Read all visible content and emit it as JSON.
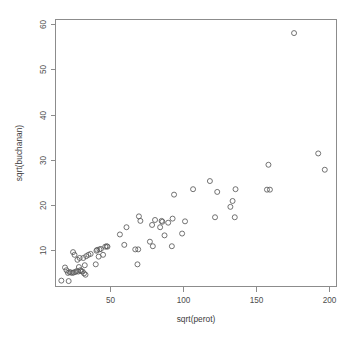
{
  "chart_data": {
    "type": "scatter",
    "title": "",
    "xlabel": "sqrt(perot)",
    "ylabel": "sqrt(buchanan)",
    "xlim": [
      13,
      205
    ],
    "ylim": [
      2,
      61
    ],
    "xticks": [
      50,
      100,
      150,
      200
    ],
    "yticks": [
      10,
      20,
      30,
      40,
      50,
      60
    ],
    "grid": false,
    "legend": null,
    "point_symbol": "open-circle",
    "point_color": "#5a5a5a",
    "axis_color": "#8c8c8c",
    "background_color": "#ffffff",
    "n_points": 67,
    "points": [
      {
        "x": 17.0,
        "y": 3.3
      },
      {
        "x": 22.0,
        "y": 3.2
      },
      {
        "x": 19.5,
        "y": 6.2
      },
      {
        "x": 20.5,
        "y": 5.6
      },
      {
        "x": 21.5,
        "y": 5.0
      },
      {
        "x": 22.5,
        "y": 5.2
      },
      {
        "x": 23.5,
        "y": 5.1
      },
      {
        "x": 24.5,
        "y": 5.0
      },
      {
        "x": 25.5,
        "y": 5.1
      },
      {
        "x": 26.5,
        "y": 5.2
      },
      {
        "x": 27.5,
        "y": 5.4
      },
      {
        "x": 28.5,
        "y": 5.3
      },
      {
        "x": 29.0,
        "y": 6.3
      },
      {
        "x": 30.0,
        "y": 5.6
      },
      {
        "x": 30.5,
        "y": 5.4
      },
      {
        "x": 31.5,
        "y": 5.3
      },
      {
        "x": 32.5,
        "y": 4.9
      },
      {
        "x": 33.0,
        "y": 6.7
      },
      {
        "x": 33.5,
        "y": 4.6
      },
      {
        "x": 25.0,
        "y": 9.6
      },
      {
        "x": 26.0,
        "y": 9.0
      },
      {
        "x": 28.0,
        "y": 7.9
      },
      {
        "x": 29.5,
        "y": 8.3
      },
      {
        "x": 32.0,
        "y": 8.3
      },
      {
        "x": 34.0,
        "y": 8.7
      },
      {
        "x": 35.5,
        "y": 9.0
      },
      {
        "x": 37.0,
        "y": 9.2
      },
      {
        "x": 40.5,
        "y": 6.9
      },
      {
        "x": 41.0,
        "y": 9.9
      },
      {
        "x": 41.5,
        "y": 10.1
      },
      {
        "x": 42.5,
        "y": 8.6
      },
      {
        "x": 43.0,
        "y": 10.2
      },
      {
        "x": 44.0,
        "y": 10.3
      },
      {
        "x": 45.5,
        "y": 9.0
      },
      {
        "x": 47.0,
        "y": 10.8
      },
      {
        "x": 48.0,
        "y": 10.9
      },
      {
        "x": 48.5,
        "y": 10.8
      },
      {
        "x": 57.0,
        "y": 13.5
      },
      {
        "x": 60.0,
        "y": 11.2
      },
      {
        "x": 61.5,
        "y": 15.1
      },
      {
        "x": 67.5,
        "y": 10.2
      },
      {
        "x": 69.0,
        "y": 6.9
      },
      {
        "x": 69.5,
        "y": 10.2
      },
      {
        "x": 70.0,
        "y": 17.5
      },
      {
        "x": 71.0,
        "y": 16.5
      },
      {
        "x": 77.5,
        "y": 11.9
      },
      {
        "x": 79.0,
        "y": 15.6
      },
      {
        "x": 79.5,
        "y": 10.9
      },
      {
        "x": 81.0,
        "y": 16.7
      },
      {
        "x": 84.5,
        "y": 15.1
      },
      {
        "x": 85.5,
        "y": 16.5
      },
      {
        "x": 86.0,
        "y": 16.3
      },
      {
        "x": 87.5,
        "y": 13.3
      },
      {
        "x": 90.0,
        "y": 16.1
      },
      {
        "x": 92.5,
        "y": 10.9
      },
      {
        "x": 93.0,
        "y": 17.0
      },
      {
        "x": 94.0,
        "y": 22.3
      },
      {
        "x": 99.5,
        "y": 13.7
      },
      {
        "x": 101.5,
        "y": 16.4
      },
      {
        "x": 107.0,
        "y": 23.5
      },
      {
        "x": 118.5,
        "y": 25.3
      },
      {
        "x": 122.0,
        "y": 17.3
      },
      {
        "x": 123.5,
        "y": 22.9
      },
      {
        "x": 132.5,
        "y": 19.6
      },
      {
        "x": 134.0,
        "y": 20.9
      },
      {
        "x": 135.5,
        "y": 17.3
      },
      {
        "x": 136.0,
        "y": 23.5
      },
      {
        "x": 157.5,
        "y": 23.4
      },
      {
        "x": 159.5,
        "y": 23.4
      },
      {
        "x": 158.5,
        "y": 28.9
      },
      {
        "x": 176.0,
        "y": 58.0
      },
      {
        "x": 192.5,
        "y": 31.4
      },
      {
        "x": 197.0,
        "y": 27.8
      }
    ]
  },
  "plot": {
    "xlabel_text": "sqrt(perot)",
    "ylabel_text": "sqrt(buchanan)",
    "xtick_labels": [
      "50",
      "100",
      "150",
      "200"
    ],
    "ytick_labels": [
      "10",
      "20",
      "30",
      "40",
      "50",
      "60"
    ]
  }
}
